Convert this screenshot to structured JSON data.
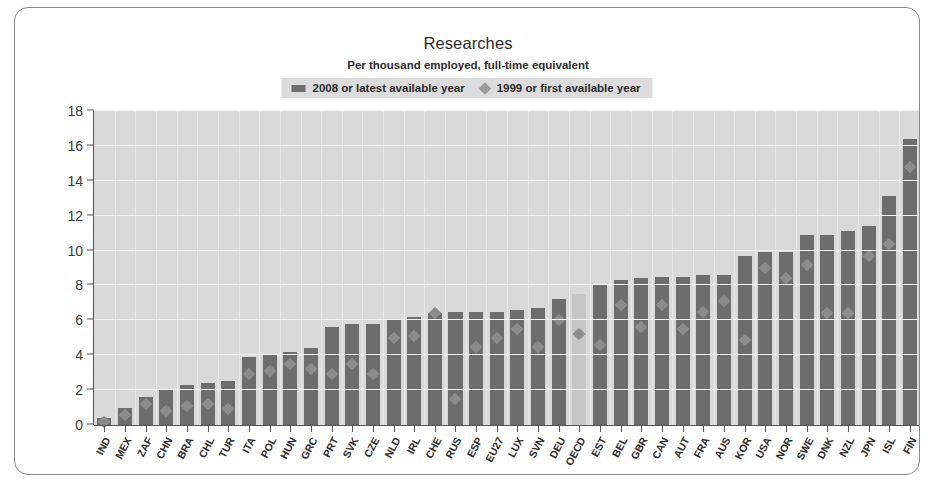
{
  "chart": {
    "title": "Researches",
    "subtitle": "Per thousand employed, full-time equivalent",
    "legend": [
      {
        "label": "2008 or latest available year",
        "marker": "bar-swatch-icon",
        "color": "#6d6d6d"
      },
      {
        "label": "1999 or first available year",
        "marker": "diamond-swatch-icon",
        "color": "#9b9b9b"
      }
    ]
  },
  "chart_data": {
    "type": "bar",
    "title": "Researches",
    "subtitle": "Per thousand employed, full-time equivalent",
    "xlabel": "",
    "ylabel": "",
    "ylim": [
      0,
      18
    ],
    "yticks": [
      0,
      2,
      4,
      6,
      8,
      10,
      12,
      14,
      16,
      18
    ],
    "grid": true,
    "legend_position": "top-center",
    "highlight_category": "OECD",
    "categories": [
      "IND",
      "MEX",
      "ZAF",
      "CHN",
      "BRA",
      "CHL",
      "TUR",
      "ITA",
      "POL",
      "HUN",
      "GRC",
      "PRT",
      "SVK",
      "CZE",
      "NLD",
      "IRL",
      "CHE",
      "RUS",
      "ESP",
      "EU27",
      "LUX",
      "SVN",
      "DEU",
      "OECD",
      "EST",
      "BEL",
      "GBR",
      "CAN",
      "AUT",
      "FRA",
      "AUS",
      "KOR",
      "USA",
      "NOR",
      "SWE",
      "DNK",
      "NZL",
      "JPN",
      "ISL",
      "FIN"
    ],
    "series": [
      {
        "name": "2008 or latest available year",
        "type": "bar",
        "color": "#6d6d6d",
        "values": [
          0.4,
          1.0,
          1.6,
          2.0,
          2.3,
          2.4,
          2.5,
          3.9,
          4.0,
          4.2,
          4.4,
          5.6,
          5.8,
          5.8,
          6.0,
          6.2,
          6.4,
          6.5,
          6.5,
          6.5,
          6.6,
          6.7,
          7.2,
          7.5,
          8.0,
          8.3,
          8.4,
          8.5,
          8.5,
          8.6,
          8.6,
          9.7,
          9.9,
          9.9,
          10.9,
          10.9,
          11.1,
          11.4,
          13.1,
          16.4
        ]
      },
      {
        "name": "1999 or first available year",
        "type": "scatter",
        "marker": "diamond",
        "color": "#9b9b9b",
        "values": [
          0.2,
          0.6,
          1.2,
          0.8,
          1.1,
          1.2,
          0.9,
          2.9,
          3.1,
          3.5,
          3.2,
          2.9,
          3.5,
          2.9,
          5.0,
          5.1,
          6.4,
          8.0,
          4.5,
          5.0,
          5.5,
          4.5,
          6.0,
          5.2,
          4.6,
          6.9,
          5.6,
          6.9,
          5.5,
          6.5,
          7.1,
          4.9,
          9.0,
          8.4,
          9.2,
          6.4,
          6.4,
          9.7,
          10.4,
          14.8
        ]
      }
    ]
  }
}
